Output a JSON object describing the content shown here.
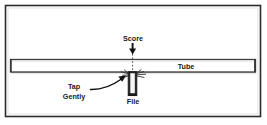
{
  "figure": {
    "background_color": "#ffffff",
    "frame": {
      "name": "outer-border",
      "color": "#2b2b2b",
      "x": 5,
      "y": 5,
      "width": 256,
      "height": 112
    },
    "tube": {
      "label": "Tube",
      "outline_color": "#3a3a3a",
      "fill_color": "#ffffff",
      "x": 10,
      "y": 59,
      "width": 246,
      "height": 13,
      "label_x": 186,
      "label_y": 69
    },
    "score": {
      "label": "Score",
      "label_x": 133,
      "label_y": 40,
      "arrow_color": "#111111",
      "dash_color": "#444444"
    },
    "file_tool": {
      "label": "File",
      "label_x": 133,
      "label_y": 103,
      "outline_color": "#111111",
      "fill_color": "#e8e8e8",
      "x": 128,
      "y": 72,
      "width": 8,
      "height": 24
    },
    "tap_gently": {
      "line1": "Tap",
      "line2": "Gently",
      "line1_x": 74,
      "line1_y": 89,
      "line2_x": 74,
      "line2_y": 98,
      "arrow_color": "#111111"
    },
    "scratch_marks": {
      "name": "scratch-marks",
      "color": "#333333",
      "count": 8
    }
  }
}
